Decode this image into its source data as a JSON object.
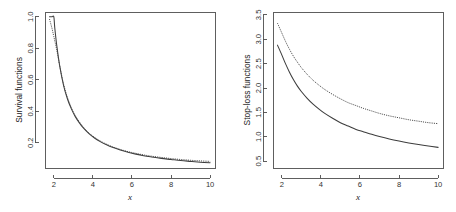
{
  "figure": {
    "background": "#ffffff",
    "panel_count": 2,
    "axis_color": "#4d4d4d",
    "curve_solid_color": "#3d3d3d",
    "curve_dotted_color": "#4a4a4a"
  },
  "chart_data": [
    {
      "type": "line",
      "panel": "left",
      "title": "",
      "xlabel": "x",
      "ylabel": "Survival functions",
      "xlim": [
        1.55,
        10.25
      ],
      "ylim": [
        0.04,
        1.03
      ],
      "xticks": [
        2,
        4,
        6,
        8,
        10
      ],
      "xtick_labels": [
        "2",
        "4",
        "6",
        "8",
        "10"
      ],
      "yticks": [
        0.2,
        0.4,
        0.6,
        0.8,
        1.0
      ],
      "ytick_labels": [
        "0.2",
        "0.4",
        "0.6",
        "0.8",
        "1.0"
      ],
      "grid": false,
      "legend": null,
      "series": [
        {
          "name": "survival-solid",
          "style": "solid",
          "x": [
            1.78,
            1.9,
            2.0,
            2.05,
            2.15,
            2.3,
            2.5,
            2.7,
            2.9,
            3.1,
            3.3,
            3.5,
            3.8,
            4.1,
            4.4,
            4.7,
            5.0,
            5.4,
            5.8,
            6.2,
            6.6,
            7.0,
            7.5,
            8.0,
            8.5,
            9.0,
            9.5,
            10.0
          ],
          "y": [
            1.0,
            1.0,
            1.0,
            0.93,
            0.82,
            0.69,
            0.565,
            0.478,
            0.415,
            0.366,
            0.328,
            0.296,
            0.258,
            0.229,
            0.206,
            0.187,
            0.171,
            0.154,
            0.14,
            0.128,
            0.118,
            0.11,
            0.101,
            0.094,
            0.087,
            0.082,
            0.077,
            0.073
          ]
        },
        {
          "name": "survival-dotted",
          "style": "dotted",
          "x": [
            1.78,
            1.9,
            2.0,
            2.15,
            2.3,
            2.5,
            2.7,
            2.9,
            3.1,
            3.3,
            3.5,
            3.8,
            4.1,
            4.4,
            4.7,
            5.0,
            5.4,
            5.8,
            6.2,
            6.6,
            7.0,
            7.5,
            8.0,
            8.5,
            9.0,
            9.5,
            10.0
          ],
          "y": [
            0.985,
            0.93,
            0.875,
            0.79,
            0.69,
            0.572,
            0.487,
            0.423,
            0.373,
            0.334,
            0.301,
            0.262,
            0.233,
            0.21,
            0.191,
            0.175,
            0.158,
            0.144,
            0.133,
            0.123,
            0.115,
            0.107,
            0.1,
            0.094,
            0.089,
            0.085,
            0.082
          ]
        }
      ]
    },
    {
      "type": "line",
      "panel": "right",
      "title": "",
      "xlabel": "x",
      "ylabel": "Stop-loss functions",
      "xlim": [
        1.55,
        10.25
      ],
      "ylim": [
        0.36,
        3.56
      ],
      "xticks": [
        2,
        4,
        6,
        8,
        10
      ],
      "xtick_labels": [
        "2",
        "4",
        "6",
        "8",
        "10"
      ],
      "yticks": [
        0.5,
        1.0,
        1.5,
        2.0,
        2.5,
        3.0,
        3.5
      ],
      "ytick_labels": [
        "0.5",
        "1.0",
        "1.5",
        "2.0",
        "2.5",
        "3.0",
        "3.5"
      ],
      "grid": false,
      "legend": null,
      "series": [
        {
          "name": "stoploss-solid",
          "style": "solid",
          "x": [
            1.78,
            2.0,
            2.2,
            2.4,
            2.6,
            2.8,
            3.0,
            3.3,
            3.6,
            3.9,
            4.2,
            4.6,
            5.0,
            5.4,
            5.8,
            6.2,
            6.6,
            7.0,
            7.5,
            8.0,
            8.5,
            9.0,
            9.5,
            10.0
          ],
          "y": [
            2.88,
            2.68,
            2.49,
            2.32,
            2.17,
            2.04,
            1.93,
            1.79,
            1.67,
            1.57,
            1.48,
            1.38,
            1.29,
            1.22,
            1.15,
            1.1,
            1.05,
            1.005,
            0.955,
            0.912,
            0.874,
            0.84,
            0.81,
            0.783
          ]
        },
        {
          "name": "stoploss-dotted",
          "style": "dotted",
          "x": [
            1.78,
            2.0,
            2.2,
            2.4,
            2.6,
            2.8,
            3.0,
            3.3,
            3.6,
            3.9,
            4.2,
            4.6,
            5.0,
            5.4,
            5.8,
            6.2,
            6.6,
            7.0,
            7.5,
            8.0,
            8.5,
            9.0,
            9.5,
            10.0
          ],
          "y": [
            3.33,
            3.13,
            2.95,
            2.79,
            2.65,
            2.53,
            2.42,
            2.28,
            2.16,
            2.06,
            1.97,
            1.87,
            1.78,
            1.7,
            1.64,
            1.58,
            1.53,
            1.48,
            1.43,
            1.39,
            1.35,
            1.32,
            1.29,
            1.27
          ]
        }
      ]
    }
  ]
}
